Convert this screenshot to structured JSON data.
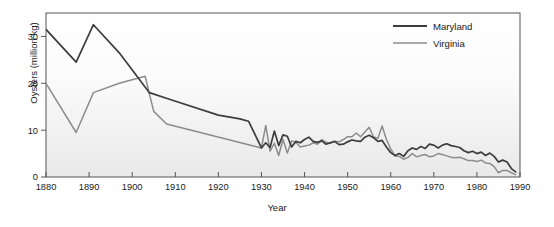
{
  "chart_data": {
    "type": "line",
    "title": "",
    "xlabel": "Year",
    "ylabel": "Oysters (million kg)",
    "xlim": [
      1880,
      1990
    ],
    "ylim": [
      0,
      35
    ],
    "xticks": [
      1880,
      1890,
      1900,
      1910,
      1920,
      1930,
      1940,
      1950,
      1960,
      1970,
      1980,
      1990
    ],
    "yticks": [
      0,
      10,
      20,
      30
    ],
    "grid": false,
    "legend_position": "top-right",
    "series": [
      {
        "name": "Maryland",
        "color": "#3d3d3d",
        "x": [
          1880,
          1887,
          1891,
          1897,
          1904,
          1909,
          1920,
          1925,
          1927,
          1930,
          1931,
          1932,
          1933,
          1934,
          1935,
          1936,
          1937,
          1938,
          1939,
          1940,
          1941,
          1942,
          1943,
          1944,
          1945,
          1946,
          1947,
          1948,
          1949,
          1950,
          1951,
          1952,
          1953,
          1954,
          1955,
          1956,
          1957,
          1958,
          1959,
          1960,
          1961,
          1962,
          1963,
          1964,
          1965,
          1966,
          1967,
          1968,
          1969,
          1970,
          1971,
          1972,
          1973,
          1974,
          1975,
          1976,
          1977,
          1978,
          1979,
          1980,
          1981,
          1982,
          1983,
          1984,
          1985,
          1986,
          1987,
          1988,
          1989
        ],
        "y": [
          31.5,
          24.5,
          32.5,
          26.5,
          18.0,
          16.5,
          13.2,
          12.4,
          11.9,
          6.2,
          7.3,
          6.3,
          9.8,
          6.7,
          9.0,
          8.7,
          6.4,
          7.6,
          7.3,
          8.0,
          8.5,
          7.6,
          7.4,
          7.7,
          7.0,
          7.3,
          7.6,
          6.9,
          7.0,
          7.5,
          7.9,
          7.7,
          7.6,
          8.5,
          8.9,
          8.4,
          7.6,
          7.8,
          6.4,
          5.2,
          4.6,
          5.0,
          4.4,
          5.6,
          6.2,
          5.9,
          6.5,
          6.1,
          7.0,
          6.8,
          6.2,
          6.8,
          7.1,
          6.7,
          6.5,
          6.3,
          5.6,
          5.2,
          5.5,
          5.0,
          5.3,
          4.6,
          5.1,
          4.4,
          3.2,
          3.6,
          3.2,
          1.8,
          1.1
        ]
      },
      {
        "name": "Virginia",
        "color": "#8c8c8c",
        "x": [
          1880,
          1887,
          1891,
          1897,
          1903,
          1905,
          1908,
          1930,
          1931,
          1932,
          1933,
          1934,
          1935,
          1936,
          1937,
          1938,
          1939,
          1940,
          1941,
          1942,
          1943,
          1944,
          1945,
          1946,
          1947,
          1948,
          1949,
          1950,
          1951,
          1952,
          1953,
          1954,
          1955,
          1956,
          1957,
          1958,
          1959,
          1960,
          1961,
          1962,
          1963,
          1964,
          1965,
          1966,
          1967,
          1968,
          1969,
          1970,
          1971,
          1972,
          1973,
          1974,
          1975,
          1976,
          1977,
          1978,
          1979,
          1980,
          1981,
          1982,
          1983,
          1984,
          1985,
          1986,
          1987,
          1988,
          1989
        ],
        "y": [
          20.0,
          9.5,
          18.0,
          20.0,
          21.5,
          14.0,
          11.3,
          6.2,
          11.0,
          5.5,
          7.2,
          4.6,
          8.0,
          5.1,
          7.7,
          7.4,
          6.4,
          6.6,
          6.8,
          7.3,
          7.0,
          8.0,
          7.4,
          7.2,
          7.6,
          7.5,
          8.0,
          8.6,
          8.6,
          9.4,
          8.6,
          9.6,
          10.6,
          8.6,
          8.2,
          10.9,
          8.0,
          6.0,
          4.5,
          4.4,
          3.8,
          4.2,
          5.0,
          4.3,
          4.6,
          4.8,
          4.3,
          4.5,
          5.0,
          4.8,
          4.5,
          4.2,
          4.1,
          4.2,
          3.9,
          3.5,
          3.5,
          3.3,
          3.6,
          3.0,
          2.9,
          2.2,
          0.9,
          1.4,
          1.4,
          0.9,
          0.5
        ]
      }
    ]
  },
  "legend": {
    "items": [
      {
        "label": "Maryland"
      },
      {
        "label": "Virginia"
      }
    ]
  },
  "axes": {
    "y_title": "Oysters (million kg)",
    "x_title": "Year"
  }
}
